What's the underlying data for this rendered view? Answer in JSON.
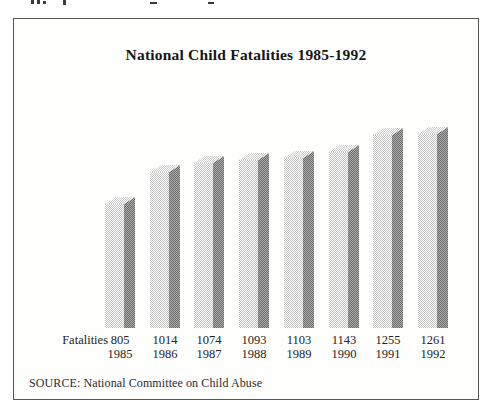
{
  "chart_data": {
    "type": "bar",
    "title": "National Child Fatalities 1985-1992",
    "row_label": "Fatalities",
    "categories": [
      "1985",
      "1986",
      "1987",
      "1988",
      "1989",
      "1990",
      "1991",
      "1992"
    ],
    "values": [
      805,
      1014,
      1074,
      1093,
      1103,
      1143,
      1255,
      1261
    ],
    "value_labels": [
      "805",
      "1014",
      "1074",
      "1093",
      "1103",
      "1143",
      "1255",
      "1261"
    ],
    "source": "SOURCE: National Committee on Child Abuse",
    "ylim": [
      0,
      1261
    ],
    "grid": false,
    "legend_position": "none",
    "style": "3d-column-dithered-grayscale"
  },
  "colors": {
    "frame_border": "#565656",
    "bar_front_light": "#ffffff",
    "bar_front_dark": "#c3c3c3",
    "bar_side_light": "#adadad",
    "bar_side_dark": "#6b6b6b",
    "bar_top_light": "#ffffff",
    "bar_top_dark": "#cccccc"
  }
}
